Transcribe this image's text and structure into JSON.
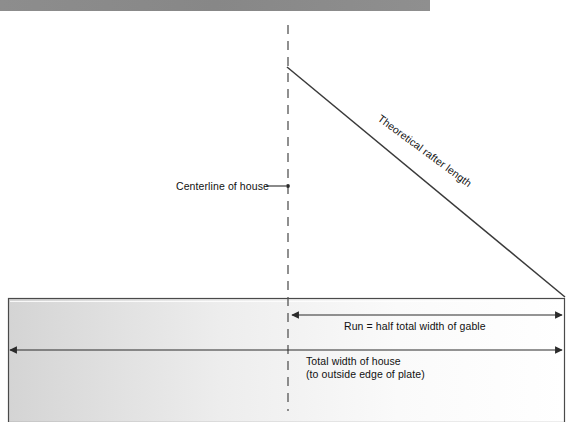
{
  "figure": {
    "kind": "roof-framing-diagram",
    "title_bar": {
      "name": "top-gray-band",
      "color": "#8a8a8a",
      "x": 0,
      "y": 0,
      "width": 430,
      "height": 11
    },
    "labels": {
      "centerline": "Centerline of house",
      "rafter": "Theoretical rafter length",
      "run": "Run = half total width of gable",
      "total_width_line1": "Total width of house",
      "total_width_line2": "(to outside edge of plate)"
    },
    "colors": {
      "line": "#3a3a3a",
      "plate_border": "#4a4a4a",
      "plate_fill_left": "#d6d6d6",
      "plate_fill_right": "#ffffff",
      "text": "#111111",
      "band_gray": "#8a8a8a"
    },
    "geometry": {
      "plate": {
        "x1": 8,
        "y1": 298,
        "x2": 565,
        "y2": 422
      },
      "centerline": {
        "x": 288,
        "y_top": 25,
        "y_bottom": 411
      },
      "rafter": {
        "peak_x": 287,
        "peak_y": 67,
        "eave_x": 565,
        "eave_y": 297
      },
      "run_arrow": {
        "x1": 291,
        "x2": 563,
        "y": 315
      },
      "total_width_arrow": {
        "x1": 9,
        "x2": 563,
        "y": 350
      },
      "leader": {
        "x1": 287,
        "x2": 268,
        "y": 186
      }
    }
  }
}
